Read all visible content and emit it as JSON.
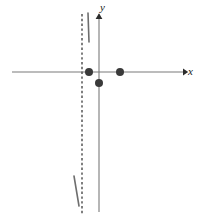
{
  "figure": {
    "title": "",
    "background_color": "#ffffff",
    "width": 200,
    "height": 219
  },
  "axes": {
    "x_axis": {
      "label": "x",
      "icon": "arrow-right-icon",
      "color": "#7a7a7a",
      "start_x": 12,
      "end_x": 183,
      "y": 72
    },
    "y_axis": {
      "label": "y",
      "icon": "arrow-up-icon",
      "color": "#7a7a7a",
      "x": 99,
      "start_y": 14,
      "end_y": 212
    },
    "origin": {
      "x": 99,
      "y": 72
    }
  },
  "asymptote": {
    "name": "vertical-asymptote",
    "style": "dashed",
    "color": "#555555",
    "x": 82,
    "start_y": 14,
    "end_y": 214
  },
  "points": [
    {
      "label": "",
      "x": 89,
      "y": 72,
      "radius": 4.0,
      "color": "#3a3a3a"
    },
    {
      "label": "",
      "x": 99,
      "y": 83,
      "radius": 4.0,
      "color": "#3a3a3a"
    },
    {
      "label": "",
      "x": 120,
      "y": 72,
      "radius": 4.0,
      "color": "#3a3a3a"
    }
  ],
  "curve_segments": [
    {
      "name": "upper-branch",
      "color": "#6e6e6e",
      "x1": 88,
      "y1": 13,
      "x2": 89,
      "y2": 42
    },
    {
      "name": "lower-branch",
      "color": "#6e6e6e",
      "x1": 74,
      "y1": 176,
      "x2": 79,
      "y2": 206
    }
  ],
  "colors": {
    "axis": "#7a7a7a",
    "point": "#3a3a3a",
    "asymptote": "#555555",
    "curve": "#6e6e6e",
    "text": "#1a1a1a"
  }
}
